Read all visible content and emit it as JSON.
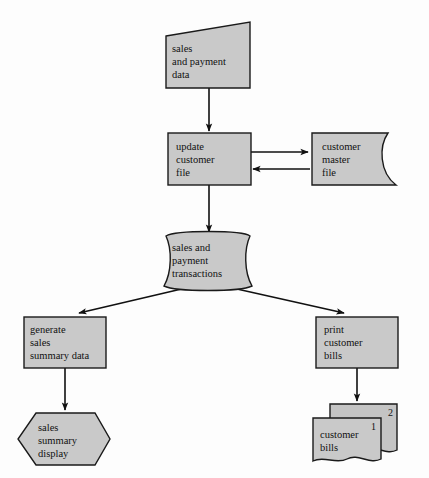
{
  "diagram": {
    "type": "system-flowchart",
    "fill_color": "#c9c9c9",
    "stroke_color": "#1a1a1a",
    "background_color": "#fdfdfd",
    "nodes": [
      {
        "id": "sales-and-payment-data",
        "shape": "input-slanted",
        "label": "sales\nand payment\ndata",
        "x": 165,
        "y": 22,
        "width": 85,
        "height": 66
      },
      {
        "id": "update-customer-file",
        "shape": "process-rectangle",
        "label": "update\ncustomer\nfile",
        "x": 168,
        "y": 133,
        "width": 83,
        "height": 52
      },
      {
        "id": "customer-master-file",
        "shape": "magnetic-tape",
        "label": "customer\nmaster\nfile",
        "x": 310,
        "y": 133,
        "width": 88,
        "height": 52
      },
      {
        "id": "sales-and-payment-transactions",
        "shape": "magnetic-tape",
        "label": "sales and\npayment\ntransactions",
        "x": 163,
        "y": 234,
        "width": 89,
        "height": 52
      },
      {
        "id": "generate-sales-summary-data",
        "shape": "process-rectangle",
        "label": "generate\nsales\nsummary data",
        "x": 24,
        "y": 317,
        "width": 82,
        "height": 51
      },
      {
        "id": "print-customer-bills",
        "shape": "process-rectangle",
        "label": "print\ncustomer\nbills",
        "x": 316,
        "y": 317,
        "width": 82,
        "height": 51
      },
      {
        "id": "sales-summary-display",
        "shape": "display-hexagon",
        "label": "sales\nsummary\ndisplay",
        "x": 18,
        "y": 413,
        "width": 92,
        "height": 52
      },
      {
        "id": "customer-bills",
        "shape": "document-stack",
        "label": "customer\nbills",
        "x": 313,
        "y": 404,
        "width": 84,
        "height": 62,
        "stack_numbers": [
          "2",
          "1"
        ]
      }
    ],
    "connectors": [
      {
        "id": "data-to-update",
        "from": "sales-and-payment-data",
        "to": "update-customer-file",
        "direction": "down"
      },
      {
        "id": "update-to-master",
        "from": "update-customer-file",
        "to": "customer-master-file",
        "direction": "right"
      },
      {
        "id": "master-to-update",
        "from": "customer-master-file",
        "to": "update-customer-file",
        "direction": "left"
      },
      {
        "id": "update-to-transactions",
        "from": "update-customer-file",
        "to": "sales-and-payment-transactions",
        "direction": "down"
      },
      {
        "id": "transactions-to-generate",
        "from": "sales-and-payment-transactions",
        "to": "generate-sales-summary-data",
        "direction": "down-left"
      },
      {
        "id": "transactions-to-print",
        "from": "sales-and-payment-transactions",
        "to": "print-customer-bills",
        "direction": "down-right"
      },
      {
        "id": "generate-to-display",
        "from": "generate-sales-summary-data",
        "to": "sales-summary-display",
        "direction": "down"
      },
      {
        "id": "print-to-bills",
        "from": "print-customer-bills",
        "to": "customer-bills",
        "direction": "down"
      }
    ]
  }
}
